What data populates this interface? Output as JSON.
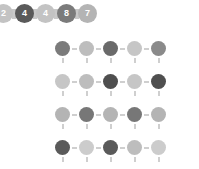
{
  "background_color": "#ffffff",
  "badge_chain": {
    "connector_color": "#c9c9c9",
    "badges": [
      {
        "label": "2",
        "color": "#c3c3c3"
      },
      {
        "label": "4",
        "color": "#5a5a5a"
      },
      {
        "label": "4",
        "color": "#c3c3c3"
      },
      {
        "label": "8",
        "color": "#7b7b7b"
      },
      {
        "label": "7",
        "color": "#b4b4b4"
      }
    ]
  },
  "node_grid": {
    "rows": 5,
    "cols": 5,
    "link_color": "#cfcfcf",
    "node_colors": [
      [
        "#7b7b7b",
        "#bdbdbd",
        "#6a6a6a",
        "#c6c6c6",
        "#8a8a8a"
      ],
      [
        "#c6c6c6",
        "#bdbdbd",
        "#4f4f4f",
        "#c6c6c6",
        "#4f4f4f"
      ],
      [
        "#b4b4b4",
        "#777777",
        "#b4b4b4",
        "#777777",
        "#b4b4b4"
      ],
      [
        "#5a5a5a",
        "#cccccc",
        "#5a5a5a",
        "#bdbdbd",
        "#cccccc"
      ],
      [
        "#838383",
        "#bdbdbd",
        "#838383",
        "#b4b4b4",
        "#838383"
      ]
    ]
  }
}
